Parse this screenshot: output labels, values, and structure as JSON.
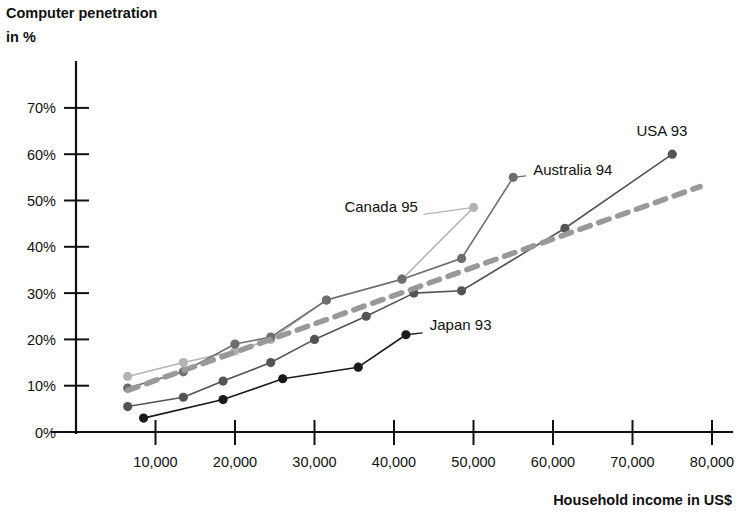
{
  "chart_data": {
    "type": "line",
    "title": "Computer penetration in %",
    "ylabel_line1": "Computer penetration",
    "ylabel_line2": "in %",
    "xlabel": "Household income in US$",
    "xlim": [
      0,
      85000
    ],
    "ylim": [
      0,
      75
    ],
    "grid": false,
    "legend": "inline-labels",
    "x_ticks": [
      10000,
      20000,
      30000,
      40000,
      50000,
      60000,
      70000,
      80000
    ],
    "x_tick_labels": [
      "10,000",
      "20,000",
      "30,000",
      "40,000",
      "50,000",
      "60,000",
      "70,000",
      "80,000"
    ],
    "y_ticks": [
      0,
      10,
      20,
      30,
      40,
      50,
      60,
      70
    ],
    "y_tick_labels": [
      "0%",
      "10%",
      "20%",
      "30%",
      "40%",
      "50%",
      "60%",
      "70%"
    ],
    "series": [
      {
        "name": "Canada 95",
        "label": "Canada 95",
        "color": "#b4b4b4",
        "dash": "none",
        "marker": "circle",
        "label_x": 43000,
        "label_y": 47.5,
        "label_anchor": "end",
        "leader_from": [
          50000,
          48.5
        ],
        "leader_to": [
          43700,
          47.0
        ],
        "x": [
          6500,
          13500,
          20000,
          24500,
          31500,
          41000,
          50000
        ],
        "y": [
          12.0,
          15.0,
          17.5,
          20.0,
          28.5,
          33.0,
          48.5
        ]
      },
      {
        "name": "Australia 94",
        "label": "Australia 94",
        "color": "#6e6e6e",
        "dash": "none",
        "marker": "circle",
        "label_x": 57500,
        "label_y": 55.5,
        "label_anchor": "start",
        "leader_from": [
          55000,
          55.0
        ],
        "leader_to": [
          56600,
          55.3
        ],
        "x": [
          6500,
          13500,
          20000,
          24500,
          31500,
          41000,
          48500,
          55000
        ],
        "y": [
          9.5,
          13.0,
          19.0,
          20.5,
          28.5,
          33.0,
          37.5,
          55.0
        ]
      },
      {
        "name": "USA 93",
        "label": "USA 93",
        "color": "#545454",
        "dash": "none",
        "marker": "circle",
        "label_x": 70500,
        "label_y": 64.0,
        "label_anchor": "start",
        "leader_from": [
          75000,
          60.0
        ],
        "leader_to": [
          75000,
          60.0
        ],
        "x": [
          6500,
          13500,
          18500,
          24500,
          30000,
          36500,
          42500,
          48500,
          61500,
          75000
        ],
        "y": [
          5.5,
          7.5,
          11.0,
          15.0,
          20.0,
          25.0,
          30.0,
          30.5,
          44.0,
          60.0
        ],
        "label_offset_note": "label above final point"
      },
      {
        "name": "Japan 93",
        "label": "Japan 93",
        "color": "#1a1a1a",
        "dash": "none",
        "marker": "circle",
        "label_x": 44500,
        "label_y": 22.0,
        "label_anchor": "start",
        "leader_from": [
          41500,
          21.0
        ],
        "leader_to": [
          43600,
          21.4
        ],
        "x": [
          8500,
          18500,
          26000,
          35500,
          41500
        ],
        "y": [
          3.0,
          7.0,
          11.5,
          14.0,
          21.0
        ]
      },
      {
        "name": "Trend",
        "label": "",
        "color": "#999999",
        "dash": "dashed",
        "marker": "none",
        "x": [
          6500,
          78500
        ],
        "y": [
          9.0,
          53.0
        ]
      }
    ]
  },
  "geometry": {
    "plot_left": 76,
    "plot_bottom": 432,
    "plot_top": 62,
    "plot_right": 730,
    "x_per_unit": 0.00795,
    "y_per_unit": 4.63
  }
}
